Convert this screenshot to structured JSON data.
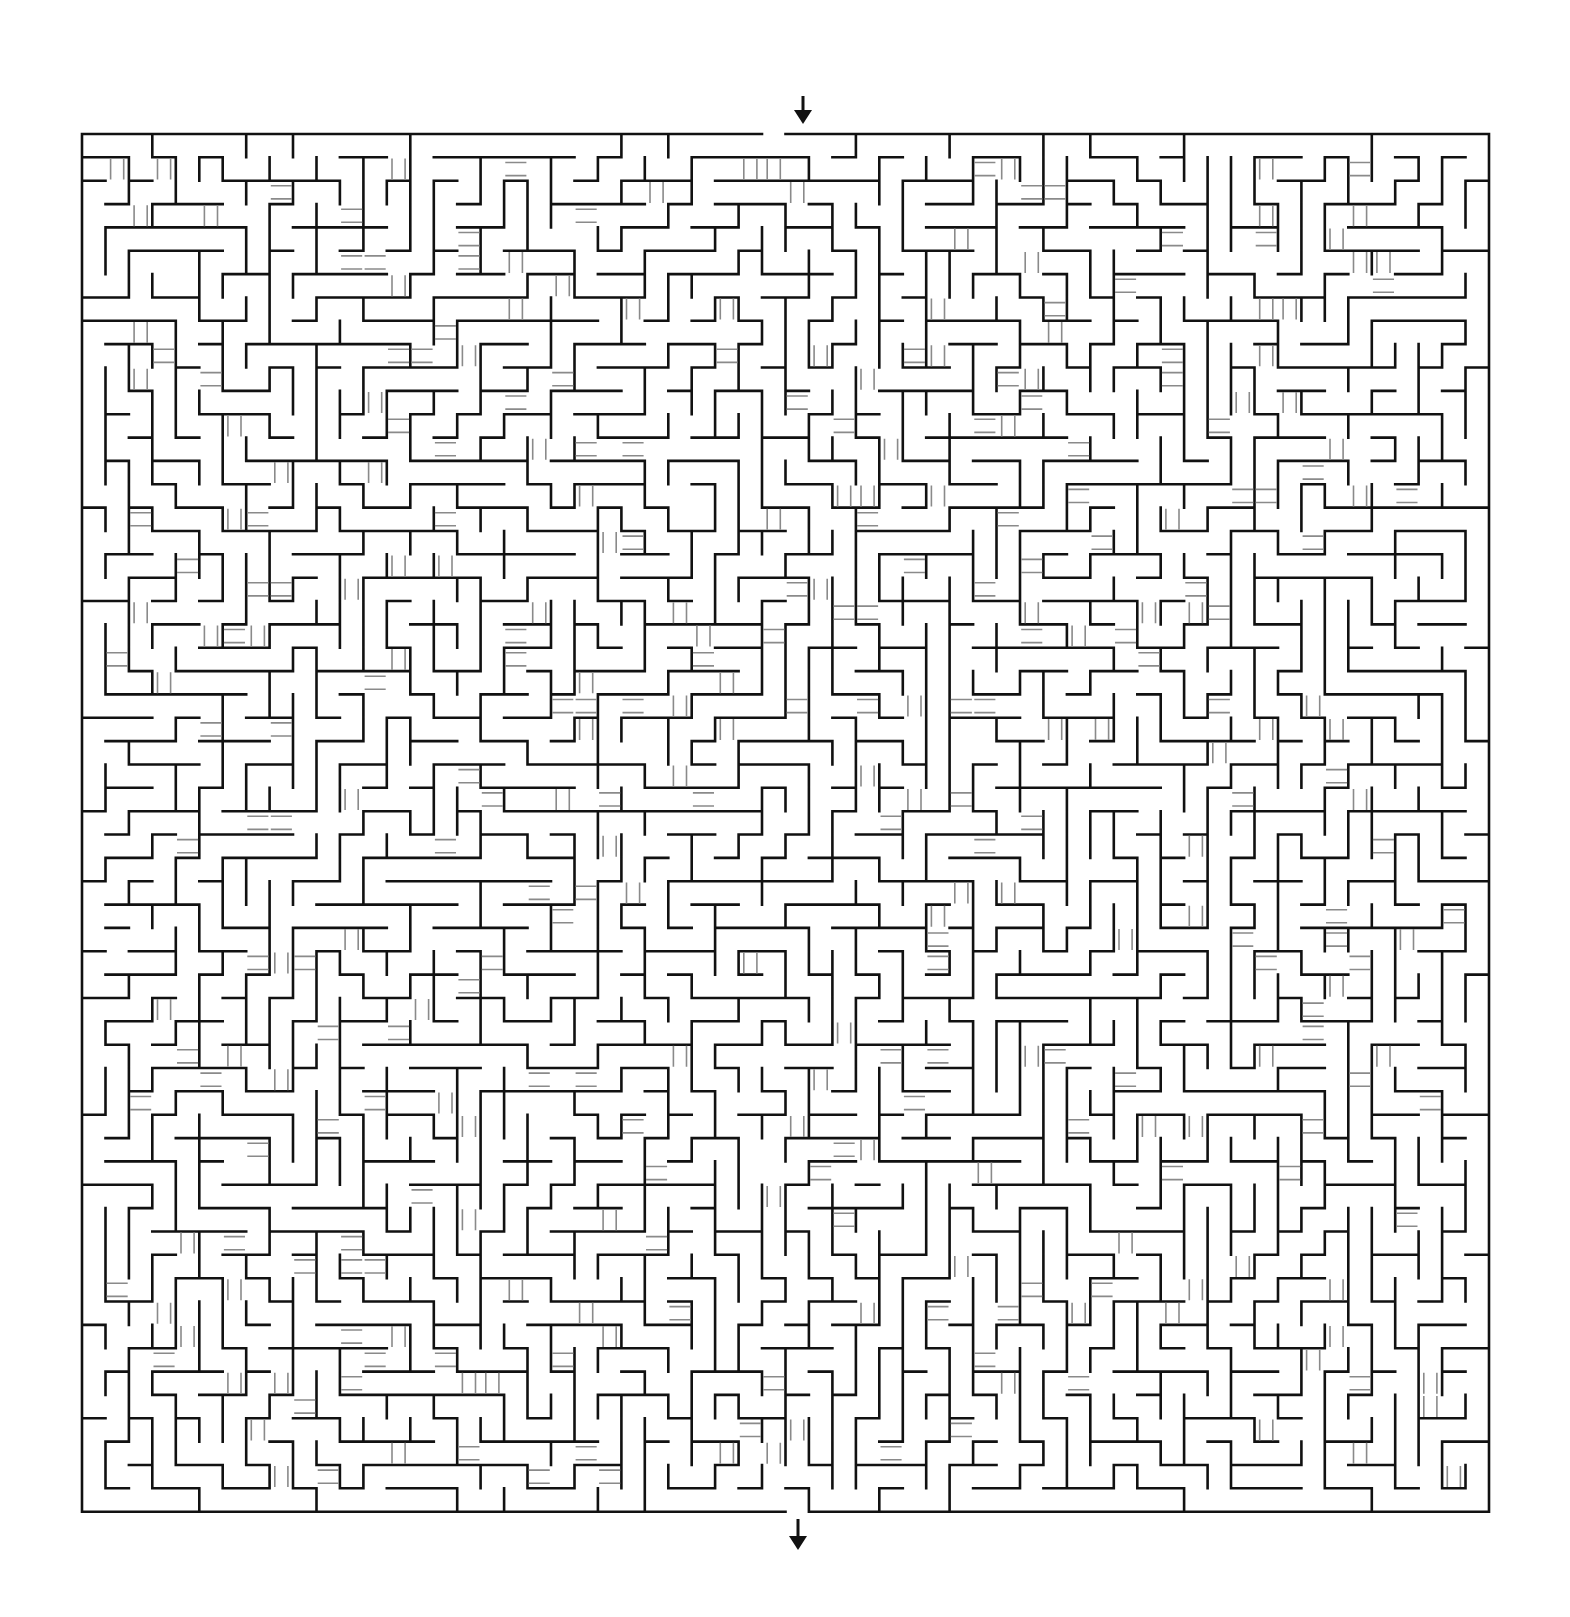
{
  "puzzle": {
    "type": "maze-with-bridges",
    "cols": 60,
    "rows": 59,
    "origin_x": 82,
    "origin_y": 134,
    "cell_w": 23.45,
    "cell_h": 23.35,
    "entrance": {
      "side": "top",
      "col": 29,
      "arrow_x": 803,
      "arrow_top": 96,
      "arrow_bottom": 124
    },
    "exit": {
      "side": "bottom",
      "col": 30,
      "arrow_x": 798,
      "arrow_top": 1519,
      "arrow_bottom": 1550
    },
    "seed": 48151623,
    "bridge_density": 0.09,
    "colors": {
      "background": "#ffffff",
      "wall": "#111111",
      "bridge": "#8a8a8a",
      "arrow": "#111111"
    },
    "wall_width": 2.6,
    "bridge_width": 1.6
  }
}
